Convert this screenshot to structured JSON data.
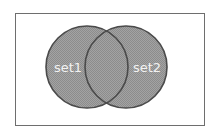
{
  "diagram": {
    "type": "venn",
    "sets": [
      {
        "label": "set1"
      },
      {
        "label": "set2"
      }
    ],
    "colors": {
      "fill": "#9a9a9a",
      "stroke": "#4a4a4a",
      "label": "#f0f0f0",
      "frame": "#6e6e6e",
      "background": "#ffffff"
    }
  }
}
